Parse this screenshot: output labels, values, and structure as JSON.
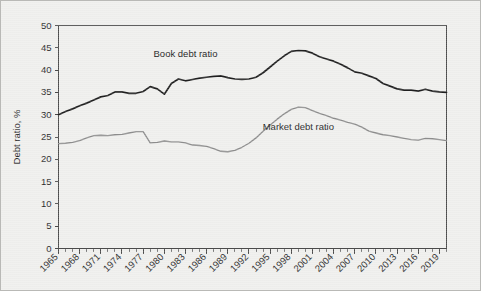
{
  "chart_data": {
    "type": "line",
    "title": "",
    "xlabel": "",
    "ylabel": "Debt ratio, %",
    "ylim": [
      0,
      50
    ],
    "ytick_step": 5,
    "yticks": [
      "0",
      "5",
      "10",
      "15",
      "20",
      "25",
      "30",
      "35",
      "40",
      "45",
      "50"
    ],
    "xlim": [
      1965,
      2020
    ],
    "xticks": [
      "1965",
      "1968",
      "1971",
      "1974",
      "1977",
      "1980",
      "1983",
      "1986",
      "1989",
      "1992",
      "1995",
      "1998",
      "2001",
      "2004",
      "2007",
      "2010",
      "2013",
      "2016",
      "2019"
    ],
    "xtick_step": 3,
    "minor_xtick_step": 1,
    "grid": false,
    "legend_position": "inline-annotation",
    "annotations": [
      {
        "text": "Book debt ratio",
        "x": 1983,
        "y": 43.0,
        "series": "Book debt ratio"
      },
      {
        "text": "Market debt ratio",
        "x": 1999,
        "y": 26.5,
        "series": "Market debt ratio"
      }
    ],
    "x": [
      1965,
      1966,
      1967,
      1968,
      1969,
      1970,
      1971,
      1972,
      1973,
      1974,
      1975,
      1976,
      1977,
      1978,
      1979,
      1980,
      1981,
      1982,
      1983,
      1984,
      1985,
      1986,
      1987,
      1988,
      1989,
      1990,
      1991,
      1992,
      1993,
      1994,
      1995,
      1996,
      1997,
      1998,
      1999,
      2000,
      2001,
      2002,
      2003,
      2004,
      2005,
      2006,
      2007,
      2008,
      2009,
      2010,
      2011,
      2012,
      2013,
      2014,
      2015,
      2016,
      2017,
      2018,
      2019,
      2020
    ],
    "series": [
      {
        "name": "Book debt ratio",
        "color": "#1f1f1f",
        "values": [
          30.0,
          30.7,
          31.3,
          32.0,
          32.6,
          33.3,
          34.0,
          34.3,
          35.1,
          35.1,
          34.8,
          34.8,
          35.2,
          36.3,
          35.8,
          34.6,
          37.0,
          38.0,
          37.6,
          37.9,
          38.2,
          38.4,
          38.6,
          38.7,
          38.3,
          38.0,
          37.9,
          38.0,
          38.4,
          39.4,
          40.7,
          42.0,
          43.2,
          44.2,
          44.4,
          44.3,
          43.8,
          43.0,
          42.5,
          42.0,
          41.3,
          40.5,
          39.6,
          39.3,
          38.7,
          38.1,
          37.0,
          36.4,
          35.8,
          35.5,
          35.5,
          35.3,
          35.7,
          35.3,
          35.1,
          35.0
        ]
      },
      {
        "name": "Market debt ratio",
        "color": "#8d8d8d",
        "values": [
          23.5,
          23.6,
          23.8,
          24.2,
          24.8,
          25.3,
          25.4,
          25.3,
          25.5,
          25.6,
          25.9,
          26.2,
          26.2,
          23.7,
          23.8,
          24.1,
          23.9,
          23.9,
          23.7,
          23.2,
          23.1,
          22.9,
          22.4,
          21.8,
          21.7,
          22.0,
          22.7,
          23.6,
          24.8,
          26.3,
          27.7,
          29.0,
          30.2,
          31.2,
          31.7,
          31.6,
          30.9,
          30.3,
          29.8,
          29.2,
          28.8,
          28.3,
          27.9,
          27.2,
          26.3,
          25.9,
          25.5,
          25.3,
          25.0,
          24.7,
          24.4,
          24.3,
          24.7,
          24.6,
          24.4,
          24.2
        ]
      }
    ],
    "book_series_points": [
      [
        1965,
        30.0
      ],
      [
        1966,
        30.6
      ],
      [
        1967,
        31.1
      ],
      [
        1968,
        31.6
      ],
      [
        1969,
        32.3
      ],
      [
        1970,
        33.0
      ],
      [
        1971,
        33.6
      ],
      [
        1972,
        33.9
      ],
      [
        1973,
        34.9
      ],
      [
        1974,
        35.2
      ],
      [
        1975,
        34.9
      ],
      [
        1976,
        34.8
      ],
      [
        1977,
        35.1
      ],
      [
        1978,
        36.4
      ],
      [
        1979,
        35.7
      ],
      [
        1980,
        34.6
      ],
      [
        1981,
        37.9
      ],
      [
        1982,
        38.0
      ],
      [
        1983,
        37.6
      ],
      [
        1984,
        37.9
      ],
      [
        1985,
        38.2
      ],
      [
        1986,
        38.3
      ],
      [
        1987,
        38.6
      ],
      [
        1988,
        38.7
      ],
      [
        1989,
        38.3
      ],
      [
        1990,
        38.0
      ],
      [
        1991,
        37.8
      ],
      [
        1992,
        38.1
      ],
      [
        1993,
        38.5
      ],
      [
        1994,
        39.6
      ],
      [
        1995,
        41.0
      ],
      [
        1996,
        42.2
      ],
      [
        1997,
        43.4
      ],
      [
        1998,
        44.3
      ],
      [
        1999,
        44.5
      ],
      [
        2000,
        44.2
      ],
      [
        2001,
        43.6
      ],
      [
        2002,
        42.8
      ],
      [
        2003,
        42.3
      ],
      [
        2004,
        41.7
      ],
      [
        2005,
        41.1
      ],
      [
        2006,
        40.2
      ],
      [
        2007,
        39.3
      ],
      [
        2008,
        39.2
      ],
      [
        2009,
        38.4
      ],
      [
        2010,
        37.8
      ],
      [
        2011,
        36.6
      ],
      [
        2012,
        36.0
      ],
      [
        2013,
        35.4
      ],
      [
        2014,
        35.3
      ],
      [
        2015,
        35.3
      ],
      [
        2016,
        35.2
      ],
      [
        2017,
        35.6
      ],
      [
        2018,
        35.2
      ],
      [
        2019,
        35.0
      ]
    ]
  },
  "axis": {
    "y_title": "Debt ratio, %"
  },
  "labels": {
    "book": "Book debt ratio",
    "market": "Market debt ratio"
  }
}
